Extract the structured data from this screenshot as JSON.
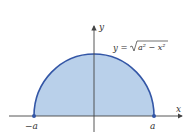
{
  "diagram": {
    "type": "semicircle-region",
    "equation": "y = √(a² − x²)",
    "equation_parts": {
      "lhs": "y =",
      "radicand": "a² − x²"
    },
    "axes": {
      "x_label": "x",
      "y_label": "y"
    },
    "points": [
      {
        "label": "−a",
        "x": -1,
        "y": 0
      },
      {
        "label": "a",
        "x": 1,
        "y": 0
      }
    ],
    "colors": {
      "fill": "#b9d0ea",
      "stroke": "#3356a6",
      "axis": "#444444",
      "point": "#3356a6"
    }
  }
}
